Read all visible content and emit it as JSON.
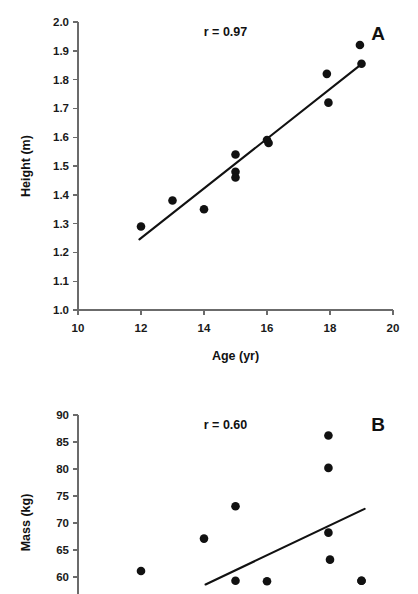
{
  "figure": {
    "panel_count": 2,
    "background": "#ffffff",
    "marker_color": "#111111",
    "line_color": "#111111",
    "axis_color": "#6b6b6b"
  },
  "chart_data": [
    {
      "type": "scatter",
      "panel_label": "A",
      "title": "",
      "annotation": "r = 0.97",
      "xlabel": "Age (yr)",
      "ylabel": "Height (m)",
      "xlim": [
        10,
        20
      ],
      "ylim": [
        1.0,
        2.0
      ],
      "xticks": [
        10,
        12,
        14,
        16,
        18,
        20
      ],
      "xtick_labels": [
        "10",
        "12",
        "14",
        "16",
        "18",
        "20"
      ],
      "yticks": [
        1.0,
        1.1,
        1.2,
        1.3,
        1.4,
        1.5,
        1.6,
        1.7,
        1.8,
        1.9,
        2.0
      ],
      "ytick_labels": [
        "1.0",
        "1.1",
        "1.2",
        "1.3",
        "1.4",
        "1.5",
        "1.6",
        "1.7",
        "1.8",
        "1.9",
        "2.0"
      ],
      "grid": false,
      "legend": "none",
      "x": [
        12.0,
        13.0,
        14.0,
        15.0,
        15.0,
        15.0,
        16.0,
        16.05,
        17.9,
        17.95,
        18.95,
        19.0
      ],
      "y": [
        1.29,
        1.38,
        1.35,
        1.54,
        1.48,
        1.46,
        1.59,
        1.58,
        1.82,
        1.72,
        1.92,
        1.855
      ],
      "trendline": {
        "x": [
          11.95,
          19.05
        ],
        "y": [
          1.245,
          1.858
        ]
      }
    },
    {
      "type": "scatter",
      "panel_label": "B",
      "title": "",
      "annotation": "r = 0.60",
      "xlabel": "",
      "ylabel": "Mass (kg)",
      "xlim": [
        10,
        20
      ],
      "ylim": [
        58.5,
        90
      ],
      "xticks": [],
      "xtick_labels": [],
      "yticks": [
        60,
        65,
        70,
        75,
        80,
        85,
        90
      ],
      "ytick_labels": [
        "60",
        "65",
        "70",
        "75",
        "80",
        "85",
        "90"
      ],
      "grid": false,
      "legend": "none",
      "x": [
        12.0,
        14.0,
        15.0,
        15.0,
        16.0,
        17.95,
        17.95,
        17.95,
        18.0,
        19.0,
        19.0
      ],
      "y": [
        61.1,
        67.1,
        73.1,
        59.3,
        59.2,
        86.2,
        80.2,
        68.2,
        63.2,
        59.3,
        59.3
      ],
      "trendline": {
        "x": [
          14.05,
          19.1
        ],
        "y": [
          58.6,
          72.6
        ]
      }
    }
  ],
  "panels": {
    "a": {
      "letter": "A",
      "annotation": "r = 0.97",
      "xlabel": "Age (yr)",
      "ylabel": "Height (m)",
      "ytick_labels": [
        "2.0",
        "1.9",
        "1.8",
        "1.7",
        "1.6",
        "1.5",
        "1.4",
        "1.3",
        "1.2",
        "1.1",
        "1.0"
      ],
      "xtick_labels": [
        "10",
        "12",
        "14",
        "16",
        "18",
        "20"
      ]
    },
    "b": {
      "letter": "B",
      "annotation": "r = 0.60",
      "ylabel": "Mass (kg)",
      "ytick_labels": [
        "90",
        "85",
        "80",
        "75",
        "70",
        "65",
        "60"
      ]
    }
  }
}
